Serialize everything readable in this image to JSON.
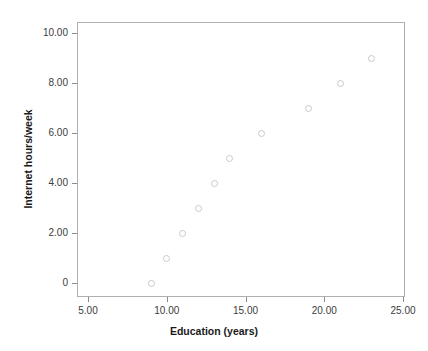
{
  "chart_data": {
    "type": "scatter",
    "title": "",
    "xlabel": "Education (years)",
    "ylabel": "Internet hours/week",
    "xlim": [
      3.6,
      25.9
    ],
    "ylim": [
      -0.5,
      10.6
    ],
    "grid": false,
    "legend": "none",
    "marker": {
      "shape": "open-circle",
      "edge_color": "#c9c9c9",
      "fill": "none",
      "size_px": 7
    },
    "frame_color": "#b0b0b0",
    "x": [
      9,
      10,
      11,
      12,
      13,
      14,
      16,
      19,
      21,
      23
    ],
    "y": [
      0,
      1,
      2,
      3,
      4,
      5,
      6,
      7,
      8,
      9
    ],
    "points": [
      {
        "x": 9,
        "y": 0
      },
      {
        "x": 10,
        "y": 1
      },
      {
        "x": 11,
        "y": 2
      },
      {
        "x": 12,
        "y": 3
      },
      {
        "x": 13,
        "y": 4
      },
      {
        "x": 14,
        "y": 5
      },
      {
        "x": 16,
        "y": 6
      },
      {
        "x": 19,
        "y": 7
      },
      {
        "x": 21,
        "y": 8
      },
      {
        "x": 23,
        "y": 9
      }
    ],
    "xticks": [
      5,
      10,
      15,
      20,
      25
    ],
    "xticklabels": [
      "5.00",
      "10.00",
      "15.00",
      "20.00",
      "25.00"
    ],
    "yticks": [
      0,
      2,
      4,
      6,
      8,
      10
    ],
    "yticklabels": [
      "0",
      "2.00",
      "4.00",
      "6.00",
      "8.00",
      "10.00"
    ]
  },
  "axes": {
    "x_title": "Education (years)",
    "y_title": "Internet hours/week"
  },
  "xticklabels": {
    "0": "5.00",
    "1": "10.00",
    "2": "15.00",
    "3": "20.00",
    "4": "25.00"
  },
  "yticklabels": {
    "0": "0",
    "1": "2.00",
    "2": "4.00",
    "3": "6.00",
    "4": "8.00",
    "5": "10.00"
  }
}
